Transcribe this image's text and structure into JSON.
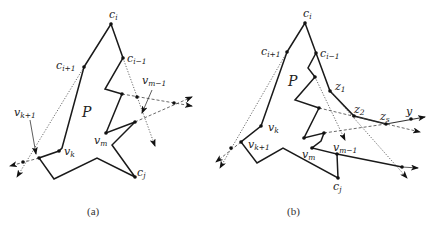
{
  "figure": {
    "panels": [
      {
        "id": "a",
        "caption": "(a)",
        "region_label": "P",
        "labels": {
          "c_i": {
            "base": "c",
            "sub": "i"
          },
          "c_i_plus_1": {
            "base": "c",
            "sub": "i+1"
          },
          "c_i_minus_1": {
            "base": "c",
            "sub": "i−1"
          },
          "v_m_minus_1": {
            "base": "v",
            "sub": "m−1"
          },
          "v_k_plus_1": {
            "base": "v",
            "sub": "k+1"
          },
          "v_k": {
            "base": "v",
            "sub": "k"
          },
          "v_m": {
            "base": "v",
            "sub": "m"
          },
          "c_j": {
            "base": "c",
            "sub": "j"
          }
        }
      },
      {
        "id": "b",
        "caption": "(b)",
        "region_label": "P",
        "labels": {
          "c_i": {
            "base": "c",
            "sub": "i"
          },
          "c_i_plus_1": {
            "base": "c",
            "sub": "i+1"
          },
          "c_i_minus_1": {
            "base": "c",
            "sub": "i−1"
          },
          "z_1": {
            "base": "z",
            "sub": "1"
          },
          "z_2": {
            "base": "z",
            "sub": "2"
          },
          "z_s": {
            "base": "z",
            "sub": "s"
          },
          "y": {
            "base": "y",
            "sub": ""
          },
          "v_k": {
            "base": "v",
            "sub": "k"
          },
          "v_k_plus_1": {
            "base": "v",
            "sub": "k+1"
          },
          "v_m": {
            "base": "v",
            "sub": "m"
          },
          "v_m_minus_1": {
            "base": "v",
            "sub": "m−1"
          },
          "c_j": {
            "base": "c",
            "sub": "j"
          }
        }
      }
    ]
  },
  "colors": {
    "stroke": "#1a1a1a",
    "background": "#ffffff"
  }
}
